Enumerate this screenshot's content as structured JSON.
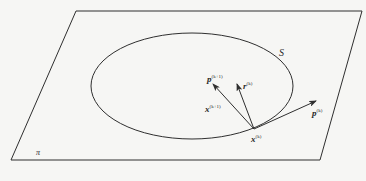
{
  "diagram": {
    "plane_label": "π",
    "surface_label": "S",
    "vectors": {
      "p_next": {
        "base": "p",
        "sup": "(k+1)"
      },
      "r_k": {
        "base": "r",
        "sup": "(k)"
      },
      "p_k": {
        "base": "p",
        "sup": "(k)"
      }
    },
    "points": {
      "x_next": {
        "base": "x",
        "sup": "(k+1)"
      },
      "x_k": {
        "base": "x",
        "sup": "(k)"
      }
    },
    "colors": {
      "stroke": "#2f2f2f",
      "background": "#f6f6f4"
    }
  }
}
